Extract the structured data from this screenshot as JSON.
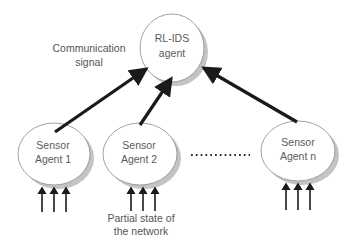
{
  "diagram": {
    "type": "multi-agent-architecture",
    "colors": {
      "background": "#ffffff",
      "node_fill": "#ffffff",
      "node_stroke": "#8a8a8a",
      "node_shadow": "#bdbdbd",
      "arrow": "#1a1a1a",
      "text": "#555555"
    },
    "nodes": {
      "rl_ids": {
        "line1": "RL-IDS",
        "line2": "agent"
      },
      "sensor_1": {
        "line1": "Sensor",
        "line2": "Agent 1"
      },
      "sensor_2": {
        "line1": "Sensor",
        "line2": "Agent 2"
      },
      "sensor_n": {
        "line1": "Sensor",
        "line2": "Agent n"
      }
    },
    "annotations": {
      "communication": {
        "line1": "Communication",
        "line2": "signal"
      },
      "partial_state": {
        "line1": "Partial state of",
        "line2": "the network"
      }
    },
    "ellipsis": "...........",
    "edges": [
      {
        "from": "sensor_1",
        "to": "rl_ids",
        "style": "thick-arrow"
      },
      {
        "from": "sensor_2",
        "to": "rl_ids",
        "style": "thick-arrow"
      },
      {
        "from": "sensor_n",
        "to": "rl_ids",
        "style": "thick-arrow"
      }
    ],
    "inputs_per_sensor": 3
  }
}
